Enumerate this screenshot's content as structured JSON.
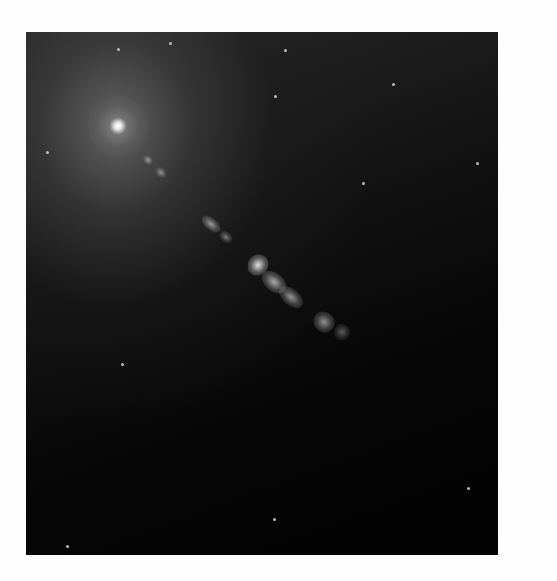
{
  "image": {
    "subject": "galaxy core with relativistic jet",
    "background_color": "#fdfdfd",
    "frame": {
      "left": 26,
      "top": 32,
      "width": 472,
      "height": 523
    },
    "core": {
      "x": 92,
      "y": 94,
      "color": "#ffffff"
    },
    "jet_knots": [
      {
        "x": 122,
        "y": 128,
        "w": 10,
        "h": 8,
        "o": 0.55
      },
      {
        "x": 135,
        "y": 140,
        "w": 12,
        "h": 9,
        "o": 0.5
      },
      {
        "x": 185,
        "y": 192,
        "w": 22,
        "h": 12,
        "o": 0.6
      },
      {
        "x": 200,
        "y": 205,
        "w": 14,
        "h": 10,
        "o": 0.45
      },
      {
        "x": 232,
        "y": 233,
        "w": 20,
        "h": 22,
        "o": 0.95
      },
      {
        "x": 248,
        "y": 250,
        "w": 28,
        "h": 18,
        "o": 0.7
      },
      {
        "x": 265,
        "y": 265,
        "w": 28,
        "h": 16,
        "o": 0.6
      },
      {
        "x": 298,
        "y": 290,
        "w": 22,
        "h": 20,
        "o": 0.6
      },
      {
        "x": 316,
        "y": 300,
        "w": 16,
        "h": 16,
        "o": 0.35
      }
    ],
    "stars": [
      {
        "x": 91,
        "y": 16
      },
      {
        "x": 143,
        "y": 10
      },
      {
        "x": 258,
        "y": 17
      },
      {
        "x": 248,
        "y": 63
      },
      {
        "x": 366,
        "y": 51
      },
      {
        "x": 20,
        "y": 119
      },
      {
        "x": 95,
        "y": 331
      },
      {
        "x": 40,
        "y": 513
      },
      {
        "x": 247,
        "y": 486
      },
      {
        "x": 441,
        "y": 455
      },
      {
        "x": 336,
        "y": 150
      },
      {
        "x": 450,
        "y": 130
      }
    ]
  }
}
